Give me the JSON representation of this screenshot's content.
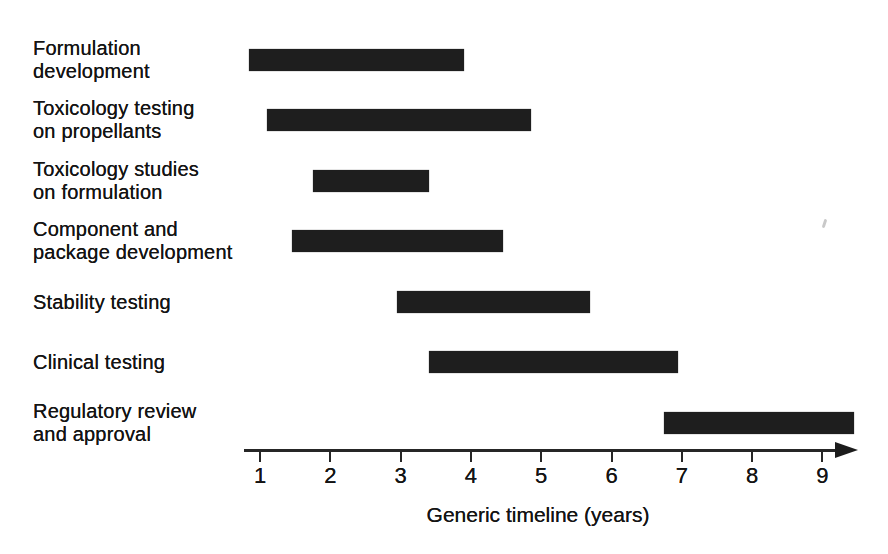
{
  "chart_data": {
    "type": "bar",
    "variant": "gantt-horizontal",
    "title": "",
    "xlabel": "Generic timeline (years)",
    "ylabel": "",
    "x_ticks": [
      1,
      2,
      3,
      4,
      5,
      6,
      7,
      8,
      9
    ],
    "xlim": [
      0.8,
      9.5
    ],
    "grid": false,
    "legend": "none",
    "bar_color": "#1e1e1e",
    "axis_color": "#262626",
    "text_color": "#141414",
    "tasks": [
      {
        "label": "Formulation development",
        "label_lines": [
          "Formulation",
          "development"
        ],
        "start": 0.85,
        "end": 3.9
      },
      {
        "label": "Toxicology testing on propellants",
        "label_lines": [
          "Toxicology testing",
          "on propellants"
        ],
        "start": 1.1,
        "end": 4.85
      },
      {
        "label": "Toxicology studies on formulation",
        "label_lines": [
          "Toxicology studies",
          "on formulation"
        ],
        "start": 1.75,
        "end": 3.4
      },
      {
        "label": "Component and package development",
        "label_lines": [
          "Component and",
          "package development"
        ],
        "start": 1.45,
        "end": 4.45
      },
      {
        "label": "Stability testing",
        "label_lines": [
          "Stability testing"
        ],
        "start": 2.95,
        "end": 5.7
      },
      {
        "label": "Clinical testing",
        "label_lines": [
          "Clinical testing"
        ],
        "start": 3.4,
        "end": 6.95
      },
      {
        "label": "Regulatory review and approval",
        "label_lines": [
          "Regulatory review",
          "and approval"
        ],
        "start": 6.75,
        "end": 9.45
      }
    ]
  }
}
